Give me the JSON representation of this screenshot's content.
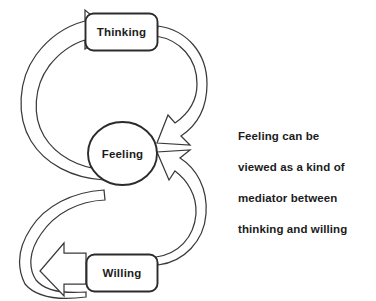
{
  "diagram": {
    "background_color": "#ffffff",
    "line_color": "#3a3a3a",
    "text_color": "#1c1c1c",
    "nodes": [
      {
        "id": "thinking",
        "label": "Thinking",
        "shape": "rounded-rectangle"
      },
      {
        "id": "feeling",
        "label": "Feeling",
        "shape": "ellipse"
      },
      {
        "id": "willing",
        "label": "Willing",
        "shape": "rounded-rectangle"
      }
    ],
    "connections": [
      {
        "from": "feeling",
        "to": "thinking",
        "style": "double-line-ribbon-arrow"
      },
      {
        "from": "thinking",
        "to": "feeling",
        "style": "double-line-ribbon-arrow"
      },
      {
        "from": "feeling",
        "to": "willing",
        "style": "double-line-ribbon-arrow"
      },
      {
        "from": "willing",
        "to": "feeling",
        "style": "double-line-ribbon-arrow"
      }
    ],
    "caption": {
      "lines": [
        "Feeling can be",
        "viewed as a kind of",
        "mediator between",
        "thinking and willing"
      ],
      "line1": "Feeling can be",
      "line2": "viewed as a kind of",
      "line3": "mediator between",
      "line4": "thinking and willing"
    }
  }
}
